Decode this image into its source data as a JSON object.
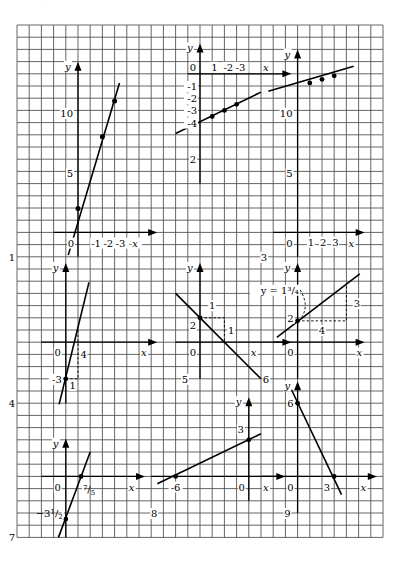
{
  "page": {
    "header_fragment": "·",
    "background": "#ffffff",
    "grid": {
      "x0": 17,
      "y0": 25,
      "cols": 30,
      "rows": 42,
      "cell_w": 12.2,
      "cell_h": 12.2,
      "color": "#555555"
    }
  },
  "panels": [
    {
      "id": "1",
      "number_label": "1",
      "origin_col": 12,
      "origin_row": 0,
      "note": "line through (0,2),(2,8),(3,11); y-axis labels 5,10; x ticks 1,2,3",
      "axis": {
        "ox_col": 5,
        "ox_row": 17,
        "xlen_left": 2,
        "xlen_right": 6,
        "yup": 13,
        "ydown": 1
      },
      "labels": {
        "y": "y",
        "x": "x",
        "zero": "0",
        "x_ticks": [
          "1",
          "2",
          "3"
        ],
        "y_ticks": [
          "5",
          "10"
        ],
        "panel": "1"
      }
    }
  ],
  "figure": {
    "panel_labels": [
      "1",
      "2",
      "3",
      "4",
      "5",
      "6",
      "7",
      "8",
      "9"
    ],
    "axis_labels": {
      "x": "x",
      "y": "y",
      "origin": "0"
    },
    "p1": {
      "x_ticks": [
        "1",
        "2",
        "3"
      ],
      "y_ticks": [
        "5",
        "10"
      ],
      "points": [
        [
          0,
          2
        ],
        [
          2,
          8
        ],
        [
          3,
          11
        ]
      ]
    },
    "p2": {
      "x_ticks": [
        "1",
        "2",
        "3"
      ],
      "y_ticks": [
        "-1",
        "-2",
        "-3",
        "-4"
      ],
      "extra_label": "2",
      "points": [
        [
          1,
          -3.5
        ],
        [
          2,
          -3
        ],
        [
          3,
          -2.5
        ]
      ]
    },
    "p3": {
      "x_ticks": [
        "1",
        "2",
        "3"
      ],
      "y_ticks": [
        "5",
        "10"
      ],
      "points": [
        [
          1,
          12.5
        ],
        [
          2,
          12.8
        ],
        [
          3,
          13.1
        ]
      ]
    },
    "p4": {
      "y_intercept": "-3",
      "rise": "4",
      "run": "1",
      "points": [
        [
          0,
          -3
        ]
      ]
    },
    "p5": {
      "y_intercept": "2",
      "run": "1",
      "drop": "1",
      "points": [
        [
          0,
          2
        ]
      ]
    },
    "p6": {
      "y_intercept": "2",
      "run": "4",
      "rise": "3",
      "annotation": "y = 1³/₄",
      "points": [
        [
          0,
          1.75
        ]
      ]
    },
    "p7": {
      "y_intercept": "-3½",
      "x_intercept": "⁷/₅",
      "y_intercept_sup": "1",
      "y_intercept_sub": "2",
      "x_intercept_sup": "7",
      "x_intercept_sub": "5",
      "points": [
        [
          0,
          -3.5
        ],
        [
          1.4,
          0
        ]
      ]
    },
    "p8": {
      "y_tick": "3",
      "x_tick": "-6",
      "points": [
        [
          -6,
          0
        ],
        [
          0,
          3
        ]
      ]
    },
    "p9": {
      "y_tick": "6",
      "x_tick": "3",
      "points": [
        [
          0,
          6
        ],
        [
          3,
          0
        ]
      ]
    }
  }
}
